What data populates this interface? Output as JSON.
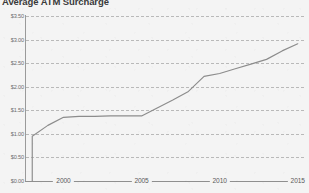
{
  "chart_data": {
    "type": "line",
    "title": "Average ATM Surcharge",
    "xlabel": "",
    "ylabel": "",
    "xlim": [
      1997.6,
      2015.4
    ],
    "ylim": [
      0.0,
      3.5
    ],
    "grid": true,
    "legend_position": "none",
    "x_ticks": [
      "2000",
      "2005",
      "2010",
      "2015"
    ],
    "x_tick_values": [
      2000,
      2005,
      2010,
      2015
    ],
    "y_ticks": [
      "$0.00",
      "$0.50",
      "$1.00",
      "$1.50",
      "$2.00",
      "$2.50",
      "$3.00",
      "$3.50"
    ],
    "y_tick_values": [
      0.0,
      0.5,
      1.0,
      1.5,
      2.0,
      2.5,
      3.0,
      3.5
    ],
    "series": [
      {
        "name": "Average ATM Surcharge",
        "color": "#8c8c8c",
        "x": [
          1998,
          1998,
          1999,
          2000,
          2001,
          2002,
          2003,
          2004,
          2005,
          2006,
          2007,
          2008,
          2009,
          2010,
          2011,
          2012,
          2013,
          2014,
          2015
        ],
        "values": [
          0.0,
          0.95,
          1.18,
          1.35,
          1.37,
          1.37,
          1.38,
          1.38,
          1.38,
          1.55,
          1.72,
          1.9,
          2.22,
          2.28,
          2.38,
          2.48,
          2.58,
          2.76,
          2.91
        ]
      }
    ]
  }
}
